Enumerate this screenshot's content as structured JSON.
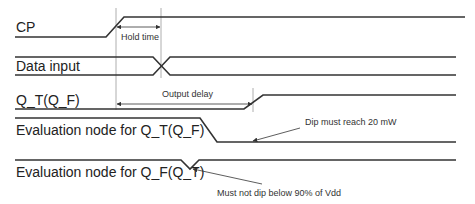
{
  "diagram": {
    "type": "timing-diagram",
    "signals": [
      {
        "id": "cp",
        "label": "CP"
      },
      {
        "id": "data_input",
        "label": "Data input"
      },
      {
        "id": "q_t",
        "label": "Q_T(Q_F)"
      },
      {
        "id": "eval_q_t",
        "label": "Evaluation node for Q_T(Q_F)"
      },
      {
        "id": "eval_q_f",
        "label": "Evaluation node for Q_F(Q_T)"
      }
    ],
    "intervals": {
      "hold_time": "Hold time",
      "output_delay": "Output delay"
    },
    "annotations": {
      "dip_reach": "Dip must reach 20 mW",
      "no_dip": "Must not dip below 90% of Vdd"
    },
    "colors": {
      "signal": "#333333",
      "guide": "#9a9a9a",
      "text": "#222222"
    }
  }
}
